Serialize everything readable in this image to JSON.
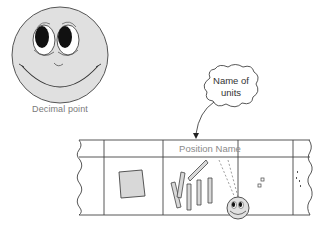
{
  "figure": {
    "big_smiley": {
      "caption": "Decimal point",
      "fill": "#e0e0e0",
      "stroke": "#555555"
    },
    "callout": {
      "line1": "Name of",
      "line2": "units"
    },
    "strip": {
      "header_label": "Position Name",
      "columns": [
        "",
        "",
        "Position Name",
        "",
        ""
      ],
      "stroke": "#444444",
      "shape_fill": "#d8d8d8"
    },
    "small_smiley": {
      "fill": "#e0e0e0"
    }
  }
}
